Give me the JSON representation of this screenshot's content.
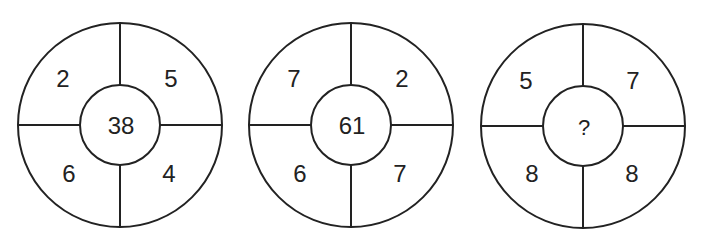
{
  "puzzle": {
    "circles": [
      {
        "top_left": "2",
        "top_right": "5",
        "bottom_left": "6",
        "bottom_right": "4",
        "center": "38"
      },
      {
        "top_left": "7",
        "top_right": "2",
        "bottom_left": "6",
        "bottom_right": "7",
        "center": "61"
      },
      {
        "top_left": "5",
        "top_right": "7",
        "bottom_left": "8",
        "bottom_right": "8",
        "center": "?"
      }
    ],
    "colors": {
      "stroke": "#222222",
      "background": "#ffffff"
    }
  }
}
